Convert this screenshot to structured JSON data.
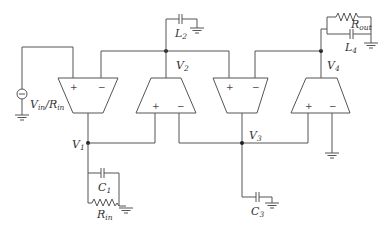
{
  "diagram": {
    "type": "circuit-schematic",
    "colors": {
      "wire": "#555555",
      "label": "#333333",
      "background": "#ffffff"
    },
    "source": {
      "label": "V",
      "label_sub": "in",
      "label_mid": "/R",
      "label_sub2": "in",
      "symbol": "current-source"
    },
    "amplifiers": [
      {
        "id": "amp1",
        "orientation": "down",
        "inputs": [
          "+",
          "−"
        ]
      },
      {
        "id": "amp2",
        "orientation": "up",
        "inputs": [
          "+",
          "−"
        ]
      },
      {
        "id": "amp3",
        "orientation": "down",
        "inputs": [
          "+",
          "−"
        ]
      },
      {
        "id": "amp4",
        "orientation": "up",
        "inputs": [
          "+",
          "−"
        ]
      }
    ],
    "nodes": {
      "v1": {
        "main": "V",
        "sub": "1"
      },
      "v2": {
        "main": "V",
        "sub": "2"
      },
      "v3": {
        "main": "V",
        "sub": "3"
      },
      "v4": {
        "main": "V",
        "sub": "4"
      }
    },
    "components": {
      "c1": {
        "main": "C",
        "sub": "1"
      },
      "rin": {
        "main": "R",
        "sub": "in"
      },
      "l2": {
        "main": "L",
        "sub": "2"
      },
      "c3": {
        "main": "C",
        "sub": "3"
      },
      "l4": {
        "main": "L",
        "sub": "4"
      },
      "rout": {
        "main": "R",
        "sub": "out"
      }
    },
    "signs": {
      "plus": "+",
      "minus": "−"
    }
  }
}
